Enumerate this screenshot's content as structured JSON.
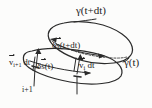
{
  "figure": {
    "background_color": "#fcfcfb",
    "ink_color": "#2b2b2b",
    "width": 152,
    "height": 108
  },
  "labels": {
    "gamma_top": "γ(t+dt)",
    "gamma_right": "γ(t)",
    "delta_s_top_prefix": "δ",
    "delta_s_top_vec": "s",
    "delta_s_top_suffix": "(t+dt)",
    "delta_s_bottom_prefix": "δ",
    "delta_s_bottom_vec": "s",
    "delta_s_bottom_suffix": "(t)",
    "v_i_vec": "v",
    "v_i_sub": "i",
    "v_i_suffix": "dt",
    "v_ip1_vec": "v",
    "v_ip1_sub": "i+1",
    "v_ip1_suffix": "dt",
    "index_marker": "i+1"
  },
  "elements": {
    "upper_loop_name": "gamma-t-plus-dt-loop",
    "lower_loop_name": "gamma-t-loop",
    "hidden_arc_name": "hidden-back-edge",
    "arrow_v_i_name": "velocity-arrow-i",
    "arrow_v_ip1_name": "velocity-arrow-i-plus-1",
    "arrow_ds_top_name": "delta-s-arrow-upper",
    "arrow_ds_bottom_name": "delta-s-arrow-lower",
    "tick_i_name": "node-tick-i",
    "tick_ip1_name": "node-tick-i-plus-1",
    "pointer_i_name": "pointer-line-i",
    "pointer_ip1_name": "pointer-line-i-plus-1"
  }
}
